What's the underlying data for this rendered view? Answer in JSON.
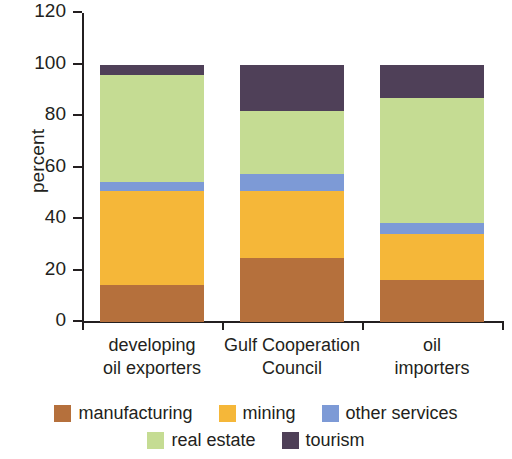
{
  "chart_data": {
    "type": "bar",
    "subtype": "stacked-100-percent",
    "title": "",
    "xlabel": "",
    "ylabel": "percent",
    "ylim": [
      0,
      120
    ],
    "yticks": [
      0,
      20,
      40,
      60,
      80,
      100,
      120
    ],
    "grid": false,
    "legend_position": "bottom",
    "categories": [
      "developing oil exporters",
      "Gulf Cooperation Council",
      "oil importers"
    ],
    "category_lines": [
      [
        "developing",
        "oil exporters"
      ],
      [
        "Gulf Cooperation",
        "Council"
      ],
      [
        "oil",
        "importers"
      ]
    ],
    "series": [
      {
        "name": "manufacturing",
        "color": "#b5703c",
        "values": [
          14.3,
          25.0,
          16.3
        ]
      },
      {
        "name": "mining",
        "color": "#f5b739",
        "values": [
          36.7,
          26.0,
          17.7
        ]
      },
      {
        "name": "other services",
        "color": "#7d9ad6",
        "values": [
          3.5,
          6.5,
          4.5
        ]
      },
      {
        "name": "real estate",
        "color": "#c5dc93",
        "values": [
          41.5,
          24.5,
          48.5
        ]
      },
      {
        "name": "tourism",
        "color": "#4f4058",
        "values": [
          4.0,
          18.0,
          13.0
        ]
      }
    ]
  },
  "axis": {
    "y_title": "percent",
    "y_tick_labels": [
      "0",
      "20",
      "40",
      "60",
      "80",
      "100",
      "120"
    ]
  },
  "legend": {
    "rows": [
      [
        {
          "label": "manufacturing",
          "color": "#b5703c"
        },
        {
          "label": "mining",
          "color": "#f5b739"
        },
        {
          "label": "other services",
          "color": "#7d9ad6"
        }
      ],
      [
        {
          "label": "real estate",
          "color": "#c5dc93"
        },
        {
          "label": "tourism",
          "color": "#4f4058"
        }
      ]
    ]
  }
}
